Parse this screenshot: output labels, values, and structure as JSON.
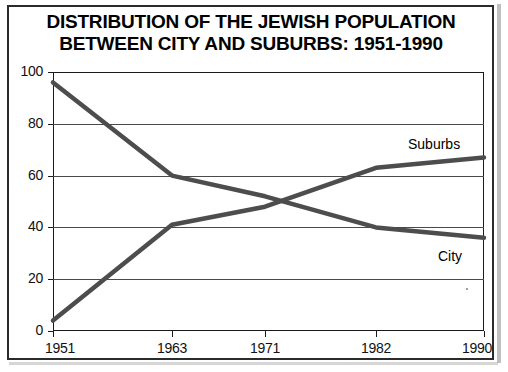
{
  "title": {
    "line1": "DISTRIBUTION OF THE JEWISH POPULATION",
    "line2": "BETWEEN CITY AND SUBURBS: 1951-1990"
  },
  "chart_data": {
    "type": "line",
    "title": "DISTRIBUTION OF THE JEWISH POPULATION BETWEEN CITY AND SUBURBS: 1951-1990",
    "xlabel": "",
    "ylabel": "",
    "x": [
      1951,
      1963,
      1971,
      1982,
      1990
    ],
    "xticklabels": [
      "1951",
      "1963",
      "1971",
      "1982",
      "1990"
    ],
    "yticks": [
      0,
      20,
      40,
      60,
      80,
      100
    ],
    "yticklabels": [
      "0",
      "20",
      "40",
      "60",
      "80",
      "100"
    ],
    "ylim": [
      0,
      100
    ],
    "xlim": [
      1951,
      1990
    ],
    "grid": "horizontal",
    "legend_position": "inline-annotations",
    "series": [
      {
        "name": "City",
        "label": "City",
        "color": "#4d4d4d",
        "values": [
          96,
          60,
          52,
          40,
          36
        ]
      },
      {
        "name": "Suburbs",
        "label": "Suburbs",
        "color": "#4d4d4d",
        "values": [
          4,
          41,
          48,
          63,
          67
        ]
      }
    ],
    "annotations": [
      {
        "text": "Suburbs",
        "x": 1982,
        "y": 72
      },
      {
        "text": "City",
        "x": 1987,
        "y": 28
      }
    ]
  }
}
